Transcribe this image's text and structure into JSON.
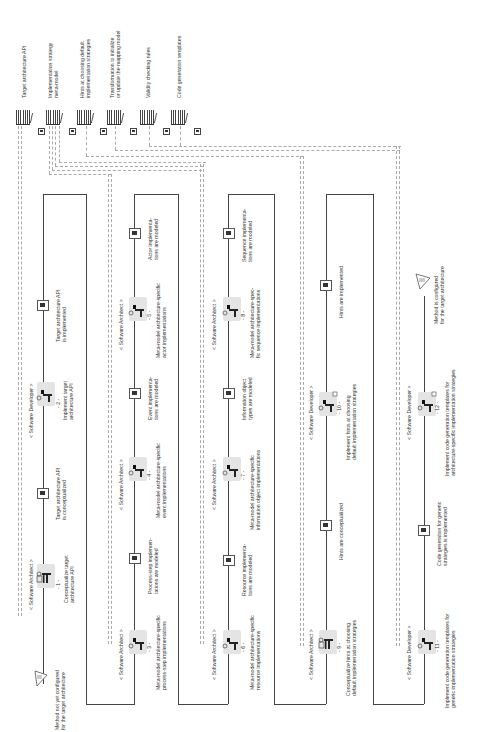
{
  "artifacts": [
    {
      "label": "Target architecture API"
    },
    {
      "label": "Implementation strategy\nmeta-model"
    },
    {
      "label": "Hints at choosing default\nimplementation strategies"
    },
    {
      "label": "Transformation to initialize\nor update the mapping model"
    },
    {
      "label": "Validity checking rules"
    },
    {
      "label": "Code generation templates"
    }
  ],
  "start_state": {
    "icon": "start-triangle-icon",
    "label": "Method not yet configured\nfor the target architecture"
  },
  "end_state": {
    "icon": "end-triangle-icon",
    "label": "Method is configured\nfor the target architecture"
  },
  "activities": [
    {
      "number": "- 1 -",
      "role": "< Software Architect >",
      "label": "Conceptualize target\narchitecture API"
    },
    {
      "number": "- 2 -",
      "role": "< Software Developer >",
      "label": "Implement target\narchitecture API"
    },
    {
      "number": "- 3 -",
      "role": "< Software Architect >",
      "label": "Meta-model architecture-specific\nprocess-step implementations"
    },
    {
      "number": "- 4 -",
      "role": "< Software Architect >",
      "label": "Meta-model architecture-specific\nevent implementations"
    },
    {
      "number": "- 5 -",
      "role": "< Software Architect >",
      "label": "Meta-model architecture-specific\nactor implementations"
    },
    {
      "number": "- 6 -",
      "role": "< Software Architect >",
      "label": "Meta-model architecture-specific\nresource implementations"
    },
    {
      "number": "- 7 -",
      "role": "< Software Architect >",
      "label": "Meta-model architecture-specific\ninformation object implementations"
    },
    {
      "number": "- 8 -",
      "role": "< Software Architect >",
      "label": "Meta-model architecture-spec-\nfic sequence implementations"
    },
    {
      "number": "- 9 -",
      "role": "< Software Architect >",
      "label": "Conceptualize hints at choosing\ndefault implementation strategies"
    },
    {
      "number": "- 10 -",
      "role": "< Software Developer >",
      "label": "Implement hints at choosing\ndefault implementation strategies"
    },
    {
      "number": "- 11 -",
      "role": "< Software Developer >",
      "label": "Implement code generation templates for\ngeneric implementation strategies"
    },
    {
      "number": "- 12 -",
      "role": "< Software Developer >",
      "label": "Implement code generation templates for\narchitecture-specific implementation strategies"
    }
  ],
  "states": [
    {
      "label": "Target architecture API\nis conceptualized"
    },
    {
      "label": "Target architecture API\nis implemented"
    },
    {
      "label": "Process-step implemen-\ntations are modeled"
    },
    {
      "label": "Event implementa-\ntions are modeled"
    },
    {
      "label": "Actor implementa-\ntions are modeled"
    },
    {
      "label": "Resource implementa-\ntions are modeled"
    },
    {
      "label": "Information object\ntypes are modeled"
    },
    {
      "label": "Sequence implementa-\ntions are modeled"
    },
    {
      "label": "Hints are conceptualized"
    },
    {
      "label": "Hints are implemented"
    },
    {
      "label": "Code generation for generic\nstrategies is implemented"
    }
  ]
}
